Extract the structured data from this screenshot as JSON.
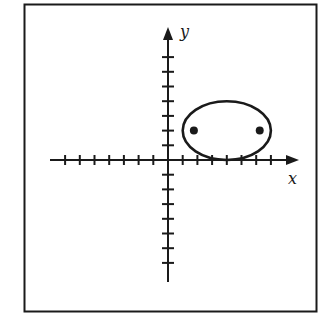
{
  "diagram": {
    "type": "coordinate-plane-ellipse",
    "axes": {
      "x_label": "x",
      "y_label": "y",
      "x_ticks_negative": 7,
      "x_ticks_positive": 7,
      "y_ticks_positive": 7,
      "y_ticks_negative": 7,
      "unit": 1
    },
    "ellipse": {
      "center": [
        4,
        2
      ],
      "semi_major_x": 3,
      "semi_minor_y": 2,
      "foci": [
        [
          1.76,
          2
        ],
        [
          6.24,
          2
        ]
      ]
    },
    "colors": {
      "ink": "#1a1a1a",
      "background": "#ffffff"
    }
  }
}
